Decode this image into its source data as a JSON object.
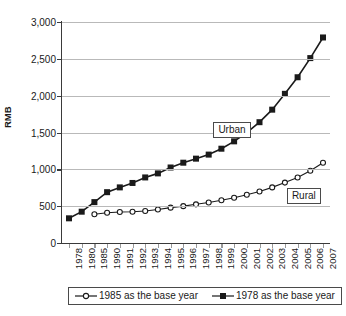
{
  "chart_data": {
    "type": "line",
    "title": "",
    "xlabel": "",
    "ylabel": "RMB",
    "ylim": [
      0,
      3000
    ],
    "yticks": [
      "0",
      "500",
      "1,000",
      "1,500",
      "2,000",
      "2,500",
      "3,000"
    ],
    "ytick_values": [
      0,
      500,
      1000,
      1500,
      2000,
      2500,
      3000
    ],
    "grid": true,
    "legend_position": "bottom",
    "categories": [
      "1978",
      "1980",
      "1985",
      "1990",
      "1991",
      "1992",
      "1993",
      "1994",
      "1995",
      "1996",
      "1997",
      "1998",
      "1999",
      "2000",
      "2001",
      "2002",
      "2003",
      "2004",
      "2005",
      "2006",
      "2007"
    ],
    "series": [
      {
        "name": "1985 as the base year",
        "annotation": "Rural",
        "marker": "open-circle",
        "values": [
          null,
          null,
          390,
          410,
          420,
          425,
          435,
          455,
          480,
          500,
          525,
          550,
          580,
          615,
          655,
          700,
          755,
          820,
          890,
          980,
          1090
        ]
      },
      {
        "name": "1978 as the base year",
        "annotation": "Urban",
        "marker": "filled-square",
        "values": [
          335,
          425,
          555,
          690,
          755,
          815,
          890,
          945,
          1025,
          1090,
          1145,
          1200,
          1280,
          1380,
          1500,
          1640,
          1810,
          2025,
          2250,
          2510,
          2790
        ]
      }
    ],
    "annotations": [
      {
        "text": "Urban"
      },
      {
        "text": "Rural"
      }
    ]
  },
  "legend": {
    "entries": [
      {
        "label": "1985 as the base year"
      },
      {
        "label": "1978 as the base year"
      }
    ]
  },
  "colors": {
    "series_line": "#1a1a1a",
    "gridline": "#b9b9b9",
    "axis": "#3a3a3a",
    "background": "#ffffff"
  }
}
